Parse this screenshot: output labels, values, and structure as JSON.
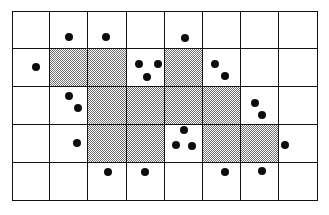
{
  "figure": {
    "background_color": "#ffffff",
    "width": 329,
    "height": 215
  },
  "grid": {
    "columns": 8,
    "rows": 5,
    "origin_x": 12,
    "origin_y": 11,
    "cell_width": 38.2,
    "cell_height": 38.0,
    "line_color": "#111111",
    "line_width": 1.5,
    "cell_fill_color": "#ffffff",
    "shaded_fill_color": "#6f6f6f",
    "shaded_pattern": "halftone-checker",
    "shaded_cells": [
      {
        "row": 1,
        "col": 1
      },
      {
        "row": 1,
        "col": 2
      },
      {
        "row": 1,
        "col": 4
      },
      {
        "row": 2,
        "col": 2
      },
      {
        "row": 2,
        "col": 3
      },
      {
        "row": 2,
        "col": 4
      },
      {
        "row": 2,
        "col": 5
      },
      {
        "row": 3,
        "col": 2
      },
      {
        "row": 3,
        "col": 3
      },
      {
        "row": 3,
        "col": 5
      },
      {
        "row": 3,
        "col": 6
      }
    ]
  },
  "chart_data": {
    "type": "scatter",
    "title": "",
    "xlabel": "",
    "ylabel": "",
    "grid": true,
    "legend": false,
    "marker_color": "#0d0d0d",
    "marker_shape": "circle",
    "point_count": 19,
    "points": [
      {
        "x": 69,
        "y": 37,
        "r": 4.2,
        "cell_row": 0,
        "cell_col": 1
      },
      {
        "x": 106,
        "y": 37,
        "r": 4.2,
        "cell_row": 0,
        "cell_col": 2
      },
      {
        "x": 185,
        "y": 38,
        "r": 4.2,
        "cell_row": 0,
        "cell_col": 4
      },
      {
        "x": 36,
        "y": 67,
        "r": 4.2,
        "cell_row": 1,
        "cell_col": 0
      },
      {
        "x": 139,
        "y": 64,
        "r": 4.2,
        "cell_row": 1,
        "cell_col": 3
      },
      {
        "x": 158,
        "y": 64,
        "r": 4.2,
        "cell_row": 1,
        "cell_col": 3
      },
      {
        "x": 147,
        "y": 77,
        "r": 4.2,
        "cell_row": 1,
        "cell_col": 3
      },
      {
        "x": 215,
        "y": 64,
        "r": 4.2,
        "cell_row": 1,
        "cell_col": 5
      },
      {
        "x": 225,
        "y": 76,
        "r": 4.2,
        "cell_row": 1,
        "cell_col": 5
      },
      {
        "x": 69,
        "y": 96,
        "r": 4.2,
        "cell_row": 2,
        "cell_col": 1
      },
      {
        "x": 78,
        "y": 108,
        "r": 4.2,
        "cell_row": 2,
        "cell_col": 1
      },
      {
        "x": 255,
        "y": 103,
        "r": 4.2,
        "cell_row": 2,
        "cell_col": 6
      },
      {
        "x": 262,
        "y": 115,
        "r": 4.2,
        "cell_row": 2,
        "cell_col": 6
      },
      {
        "x": 77,
        "y": 143,
        "r": 4.2,
        "cell_row": 3,
        "cell_col": 1
      },
      {
        "x": 184,
        "y": 130,
        "r": 4.2,
        "cell_row": 3,
        "cell_col": 4
      },
      {
        "x": 176,
        "y": 145,
        "r": 4.2,
        "cell_row": 3,
        "cell_col": 4
      },
      {
        "x": 192,
        "y": 146,
        "r": 4.2,
        "cell_row": 3,
        "cell_col": 4
      },
      {
        "x": 285,
        "y": 145,
        "r": 4.2,
        "cell_row": 3,
        "cell_col": 7
      },
      {
        "x": 108,
        "y": 172,
        "r": 4.2,
        "cell_row": 4,
        "cell_col": 2
      },
      {
        "x": 145,
        "y": 172,
        "r": 4.2,
        "cell_row": 4,
        "cell_col": 3
      },
      {
        "x": 225,
        "y": 172,
        "r": 4.2,
        "cell_row": 4,
        "cell_col": 5
      },
      {
        "x": 262,
        "y": 171,
        "r": 4.2,
        "cell_row": 4,
        "cell_col": 6
      }
    ]
  }
}
